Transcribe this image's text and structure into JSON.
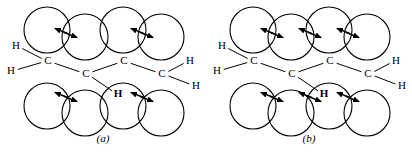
{
  "figure": {
    "type": "molecular-space-filling-diagram",
    "stroke_color": "#000000",
    "background_color": "#ffffff"
  },
  "panels": [
    {
      "id": "a",
      "caption": "(a)",
      "atom_labels": {
        "carbon": "C",
        "hydrogen": "H",
        "hydrogen_bold": "H"
      },
      "carbons": [
        {
          "label": "C",
          "x": 48,
          "y": 61
        },
        {
          "label": "C",
          "x": 86,
          "y": 74
        },
        {
          "label": "C",
          "x": 124,
          "y": 61
        },
        {
          "label": "C",
          "x": 162,
          "y": 74
        }
      ],
      "hydrogens": [
        {
          "label": "H",
          "x": 16,
          "y": 46,
          "bold": false
        },
        {
          "label": "H",
          "x": 11,
          "y": 71,
          "bold": false
        },
        {
          "label": "H",
          "x": 190,
          "y": 61,
          "bold": false
        },
        {
          "label": "H",
          "x": 196,
          "y": 86,
          "bold": false
        },
        {
          "label": "H",
          "x": 118,
          "y": 94,
          "bold": true
        }
      ],
      "top_spheres": [
        {
          "cx": 47,
          "cy": 30,
          "r": 23
        },
        {
          "cx": 85,
          "cy": 37,
          "r": 23
        },
        {
          "cx": 123,
          "cy": 30,
          "r": 23
        },
        {
          "cx": 161,
          "cy": 37,
          "r": 23
        }
      ],
      "bottom_spheres": [
        {
          "cx": 47,
          "cy": 106,
          "r": 23
        },
        {
          "cx": 85,
          "cy": 113,
          "r": 23
        },
        {
          "cx": 123,
          "cy": 106,
          "r": 23
        },
        {
          "cx": 161,
          "cy": 113,
          "r": 23
        }
      ],
      "arrow_pairs_top": [
        {
          "cx": 66,
          "cy": 33
        },
        {
          "cx": 142,
          "cy": 33
        }
      ],
      "arrow_pairs_bottom": [
        {
          "cx": 66,
          "cy": 97
        },
        {
          "cx": 142,
          "cy": 97
        }
      ],
      "arrow_pair_count_top": 2,
      "arrow_pair_count_bottom": 2
    },
    {
      "id": "b",
      "caption": "(b)",
      "atom_labels": {
        "carbon": "C",
        "hydrogen": "H",
        "hydrogen_bold": "H"
      },
      "carbons": [
        {
          "label": "C",
          "x": 48,
          "y": 61
        },
        {
          "label": "C",
          "x": 86,
          "y": 74
        },
        {
          "label": "C",
          "x": 124,
          "y": 61
        },
        {
          "label": "C",
          "x": 162,
          "y": 74
        }
      ],
      "hydrogens": [
        {
          "label": "H",
          "x": 16,
          "y": 46,
          "bold": false
        },
        {
          "label": "H",
          "x": 11,
          "y": 71,
          "bold": false
        },
        {
          "label": "H",
          "x": 190,
          "y": 61,
          "bold": false
        },
        {
          "label": "H",
          "x": 196,
          "y": 86,
          "bold": false
        },
        {
          "label": "H",
          "x": 118,
          "y": 94,
          "bold": true
        }
      ],
      "top_spheres": [
        {
          "cx": 47,
          "cy": 30,
          "r": 23
        },
        {
          "cx": 85,
          "cy": 37,
          "r": 23
        },
        {
          "cx": 123,
          "cy": 30,
          "r": 23
        },
        {
          "cx": 161,
          "cy": 37,
          "r": 23
        }
      ],
      "bottom_spheres": [
        {
          "cx": 47,
          "cy": 106,
          "r": 23
        },
        {
          "cx": 85,
          "cy": 113,
          "r": 23
        },
        {
          "cx": 123,
          "cy": 106,
          "r": 23
        },
        {
          "cx": 161,
          "cy": 113,
          "r": 23
        }
      ],
      "arrow_pairs_top": [
        {
          "cx": 66,
          "cy": 33
        },
        {
          "cx": 104,
          "cy": 33
        },
        {
          "cx": 142,
          "cy": 33
        }
      ],
      "arrow_pairs_bottom": [
        {
          "cx": 66,
          "cy": 97
        },
        {
          "cx": 104,
          "cy": 97
        },
        {
          "cx": 142,
          "cy": 97
        }
      ],
      "arrow_pair_count_top": 3,
      "arrow_pair_count_bottom": 3
    }
  ]
}
